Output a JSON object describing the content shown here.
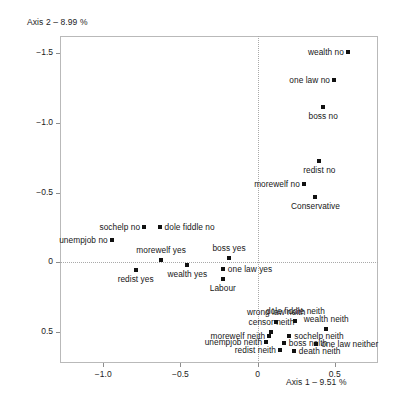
{
  "chart_data": {
    "type": "scatter",
    "title": "",
    "xlabel": "Axis 1 – 9.51 %",
    "ylabel": "Axis 2 – 8.99 %",
    "xlim": [
      -1.28,
      0.78
    ],
    "ylim": [
      -1.62,
      0.72
    ],
    "y_axis_inverted": true,
    "grid": false,
    "legend": "none",
    "origin_lines": {
      "x": 0,
      "y": 0,
      "style": "dotted"
    },
    "xticks": [
      -1.0,
      -0.5,
      0,
      0.5
    ],
    "xtick_labels": [
      "−1.0",
      "−0.5",
      "0",
      "0.5"
    ],
    "yticks": [
      -1.5,
      -1.0,
      -0.5,
      0,
      0.5
    ],
    "ytick_labels": [
      "−1.5",
      "−1.0",
      "−0.5",
      "0",
      "0.5"
    ],
    "marker": {
      "shape": "square",
      "color": "#111111",
      "size": 4
    },
    "points": [
      {
        "label": "wealth no",
        "x": 0.585,
        "y": -1.505,
        "label_pos": "left"
      },
      {
        "label": "one law no",
        "x": 0.495,
        "y": -1.305,
        "label_pos": "left"
      },
      {
        "label": "boss no",
        "x": 0.425,
        "y": -1.115,
        "label_pos": "below"
      },
      {
        "label": "redist no",
        "x": 0.4,
        "y": -0.725,
        "label_pos": "below"
      },
      {
        "label": "morewelf no",
        "x": 0.3,
        "y": -0.56,
        "label_pos": "left"
      },
      {
        "label": "Conservative",
        "x": 0.375,
        "y": -0.47,
        "label_pos": "below"
      },
      {
        "label": "sochelp no",
        "x": -0.735,
        "y": -0.25,
        "label_pos": "left"
      },
      {
        "label": "dole fiddle no",
        "x": -0.635,
        "y": -0.25,
        "label_pos": "right"
      },
      {
        "label": "unempjob no",
        "x": -0.945,
        "y": -0.16,
        "label_pos": "left"
      },
      {
        "label": "morewelf yes",
        "x": -0.625,
        "y": -0.02,
        "label_pos": "above"
      },
      {
        "label": "boss yes",
        "x": -0.185,
        "y": -0.03,
        "label_pos": "above"
      },
      {
        "label": "wealth yes",
        "x": -0.455,
        "y": 0.02,
        "label_pos": "below"
      },
      {
        "label": "one law yes",
        "x": -0.225,
        "y": 0.05,
        "label_pos": "right"
      },
      {
        "label": "redist yes",
        "x": -0.79,
        "y": 0.055,
        "label_pos": "below"
      },
      {
        "label": "Labour",
        "x": -0.225,
        "y": 0.12,
        "label_pos": "below"
      },
      {
        "label": "wrong law neith",
        "x": 0.12,
        "y": 0.425,
        "label_pos": "above"
      },
      {
        "label": "dole fiddle neith",
        "x": 0.245,
        "y": 0.42,
        "label_pos": "above"
      },
      {
        "label": "wealth neith",
        "x": 0.445,
        "y": 0.48,
        "label_pos": "above"
      },
      {
        "label": "censor neith",
        "x": 0.09,
        "y": 0.5,
        "label_pos": "above"
      },
      {
        "label": "sochelp neith",
        "x": 0.205,
        "y": 0.53,
        "label_pos": "right"
      },
      {
        "label": "morewelf neith",
        "x": 0.075,
        "y": 0.53,
        "label_pos": "left"
      },
      {
        "label": "boss neith",
        "x": 0.17,
        "y": 0.58,
        "label_pos": "right"
      },
      {
        "label": "unempjob neith",
        "x": 0.055,
        "y": 0.57,
        "label_pos": "left"
      },
      {
        "label": "one law neither",
        "x": 0.38,
        "y": 0.585,
        "label_pos": "right"
      },
      {
        "label": "redist neith",
        "x": 0.145,
        "y": 0.63,
        "label_pos": "left"
      },
      {
        "label": "death neith",
        "x": 0.235,
        "y": 0.635,
        "label_pos": "right"
      }
    ]
  }
}
